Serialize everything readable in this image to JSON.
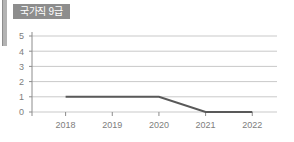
{
  "panel": {
    "title": "국가직 9급",
    "title_badge_color": "#8d8d8d",
    "title_text_color": "#ffffff",
    "accent_bar_color": "#b3b3b3"
  },
  "chart_data": {
    "type": "line",
    "title": "국가직 9급",
    "xlabel": "",
    "ylabel": "",
    "categories": [
      "2018",
      "2019",
      "2020",
      "2021",
      "2022"
    ],
    "series": [
      {
        "name": "국가직 9급",
        "values": [
          1,
          1,
          1,
          0,
          0
        ],
        "color": "#595959"
      }
    ],
    "ylim": [
      0,
      5
    ],
    "yticks": [
      "0",
      "1",
      "2",
      "3",
      "4",
      "5"
    ],
    "grid": true,
    "grid_color": "#c9c9c9",
    "axis_color": "#8c8c8c",
    "legend": "none",
    "legend_position": "none"
  }
}
